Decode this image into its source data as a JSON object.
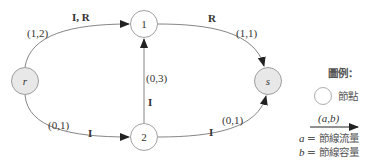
{
  "diagram": {
    "type": "flow-network",
    "nodes": [
      {
        "id": "r",
        "label": "r",
        "italic": true,
        "fill": "#e8e8e8"
      },
      {
        "id": "1",
        "label": "1",
        "italic": false,
        "fill": "#ffffff"
      },
      {
        "id": "2",
        "label": "2",
        "italic": false,
        "fill": "#ffffff"
      },
      {
        "id": "s",
        "label": "s",
        "italic": true,
        "fill": "#e8e8e8"
      }
    ],
    "edges": [
      {
        "from": "r",
        "to": "1",
        "flow_cap": "(1,2)",
        "path_label": "I, R"
      },
      {
        "from": "1",
        "to": "s",
        "flow_cap": "(1,1)",
        "path_label": "R"
      },
      {
        "from": "2",
        "to": "1",
        "flow_cap": "(0,3)",
        "path_label": "I"
      },
      {
        "from": "r",
        "to": "2",
        "flow_cap": "(0,1)",
        "path_label": "I"
      },
      {
        "from": "2",
        "to": "s",
        "flow_cap": "(0,1)",
        "path_label": "I"
      }
    ]
  },
  "legend": {
    "title": "圖例：",
    "node_label": "節點",
    "arrow_label": "(a,b)",
    "a_var": "a",
    "a_desc": "= 節線流量",
    "b_var": "b",
    "b_desc": "= 節線容量"
  },
  "colors": {
    "line": "#555555",
    "arrow": "#222222",
    "node_stroke": "#888888",
    "shaded_node": "#e8e8e8"
  }
}
